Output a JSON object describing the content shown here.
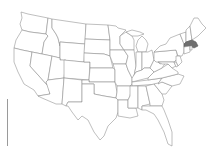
{
  "map": {
    "title": "United States",
    "highlighted_state": "Massachusetts",
    "highlight_color": "#6e6e6e",
    "stroke_color": "#8a8a8a",
    "fill_color": "#ffffff"
  },
  "legend": {
    "bar_label": ""
  }
}
